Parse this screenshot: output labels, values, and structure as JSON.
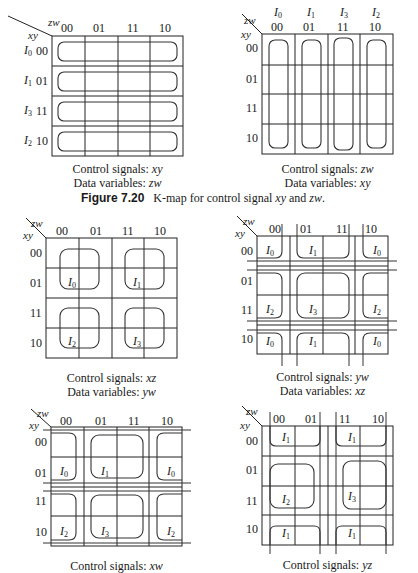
{
  "figure": {
    "number": "Figure 7.20",
    "caption": "K-map for control signal xy and zw.",
    "caption_prefix": "K-map for control signal ",
    "caption_v1": "xy",
    "caption_and": " and ",
    "caption_v2": "zw",
    "caption_end": "."
  },
  "axis": {
    "row_var": "xy",
    "col_var": "zw",
    "gray": [
      "00",
      "01",
      "11",
      "10"
    ]
  },
  "maps": [
    {
      "id": "map-xy",
      "x": 52,
      "y": 36,
      "row_inputs": [
        "I0",
        "I1",
        "I3",
        "I2"
      ],
      "col_inputs": [],
      "control_label": "Control signals: ",
      "control_value": "xy",
      "data_label": "Data variables: ",
      "data_value": "zw"
    },
    {
      "id": "map-zw",
      "x": 262,
      "y": 34,
      "row_inputs": [],
      "col_inputs": [
        "I0",
        "I1",
        "I3",
        "I2"
      ],
      "control_label": "Control signals: ",
      "control_value": "zw",
      "data_label": "Data variables: ",
      "data_value": "xy"
    },
    {
      "id": "map-xz",
      "x": 46,
      "y": 238,
      "cells": [
        [
          "I0",
          1,
          0
        ],
        [
          "I1",
          1,
          2
        ],
        [
          "I2",
          3,
          0
        ],
        [
          "I3",
          3,
          2
        ]
      ],
      "control_label": "Control signals: ",
      "control_value": "xz",
      "data_label": "Data variables: ",
      "data_value": "yw"
    },
    {
      "id": "map-yw",
      "x": 257,
      "y": 236,
      "cells": [
        [
          "I0",
          0,
          0
        ],
        [
          "I1",
          0,
          1
        ],
        [
          "I0",
          0,
          3
        ],
        [
          "I2",
          2,
          0
        ],
        [
          "I3",
          2,
          1
        ],
        [
          "I2",
          2,
          3
        ],
        [
          "I0",
          3,
          0
        ],
        [
          "I1",
          3,
          1
        ],
        [
          "I0",
          3,
          3
        ]
      ],
      "control_label": "Control signals: ",
      "control_value": "yw",
      "data_label": "Data variables: ",
      "data_value": "xz"
    },
    {
      "id": "map-xw",
      "x": 51,
      "y": 427,
      "cells": [
        [
          "I0",
          1,
          0
        ],
        [
          "I1",
          1,
          1
        ],
        [
          "I0",
          1,
          3
        ],
        [
          "I2",
          3,
          0
        ],
        [
          "I3",
          3,
          1
        ],
        [
          "I2",
          3,
          3
        ]
      ],
      "control_label": "Control signals: ",
      "control_value": "xw"
    },
    {
      "id": "map-yz",
      "x": 262,
      "y": 426,
      "cells": [
        [
          "I1",
          0,
          0
        ],
        [
          "I1",
          0,
          2
        ],
        [
          "I2",
          2,
          0
        ],
        [
          "I3",
          2,
          2
        ],
        [
          "I1",
          3,
          0
        ],
        [
          "I1",
          3,
          2
        ]
      ],
      "control_label": "Control signals: ",
      "control_value": "yz"
    }
  ]
}
